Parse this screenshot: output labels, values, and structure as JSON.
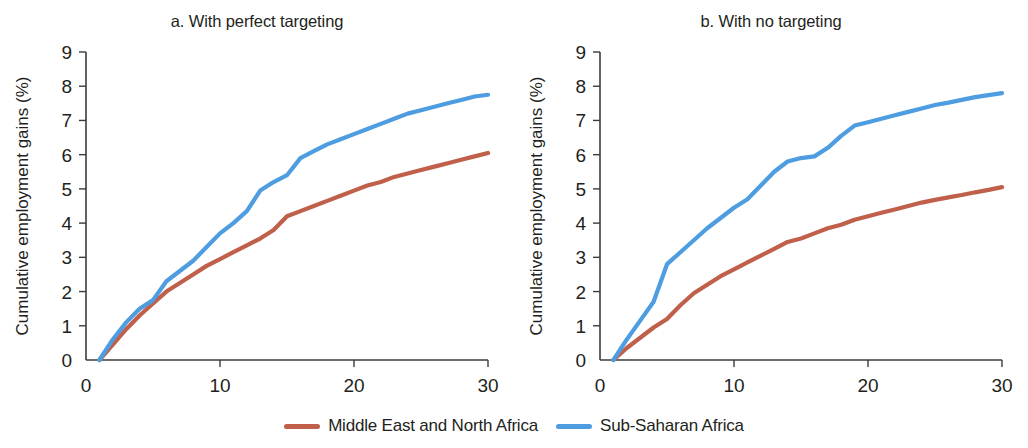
{
  "figure": {
    "background": "#ffffff",
    "legend": {
      "position": "bottom-center",
      "items": [
        {
          "label": "Middle East and North Africa",
          "color": "#c0604b",
          "swatch": "line-swatch"
        },
        {
          "label": "Sub-Saharan Africa",
          "color": "#4d9de0",
          "swatch": "line-swatch"
        }
      ]
    }
  },
  "chart_data": [
    {
      "type": "line",
      "panel": "a",
      "title": "a. With perfect targeting",
      "xlabel": "Year",
      "ylabel": "Cumulative employment gains (%)",
      "xlim": [
        0,
        30
      ],
      "ylim": [
        0,
        9
      ],
      "xticks": [
        0,
        10,
        20,
        30
      ],
      "xtick_labels": [
        "0",
        "10",
        "20",
        "30"
      ],
      "yticks": [
        0,
        1,
        2,
        3,
        4,
        5,
        6,
        7,
        8,
        9
      ],
      "ytick_labels": [
        "0",
        "1",
        "2",
        "3",
        "4",
        "5",
        "6",
        "7",
        "8",
        "9"
      ],
      "grid": false,
      "x": [
        1,
        2,
        3,
        4,
        5,
        6,
        7,
        8,
        9,
        10,
        11,
        12,
        13,
        14,
        15,
        16,
        17,
        18,
        19,
        20,
        21,
        22,
        23,
        24,
        25,
        26,
        27,
        28,
        29,
        30
      ],
      "series": [
        {
          "name": "Middle East and North Africa",
          "color": "#c0604b",
          "values": [
            0.0,
            0.45,
            0.9,
            1.3,
            1.65,
            2.0,
            2.25,
            2.5,
            2.75,
            2.95,
            3.15,
            3.35,
            3.55,
            3.8,
            4.2,
            4.35,
            4.5,
            4.65,
            4.8,
            4.95,
            5.1,
            5.2,
            5.35,
            5.45,
            5.55,
            5.65,
            5.75,
            5.85,
            5.95,
            6.05
          ]
        },
        {
          "name": "Sub-Saharan Africa",
          "color": "#4d9de0",
          "values": [
            0.0,
            0.6,
            1.1,
            1.5,
            1.75,
            2.3,
            2.6,
            2.9,
            3.3,
            3.7,
            4.0,
            4.35,
            4.95,
            5.2,
            5.4,
            5.9,
            6.1,
            6.3,
            6.45,
            6.6,
            6.75,
            6.9,
            7.05,
            7.2,
            7.3,
            7.4,
            7.5,
            7.6,
            7.7,
            7.75
          ]
        }
      ]
    },
    {
      "type": "line",
      "panel": "b",
      "title": "b. With no targeting",
      "xlabel": "Year",
      "ylabel": "Cumulative employment gains (%)",
      "xlim": [
        0,
        30
      ],
      "ylim": [
        0,
        9
      ],
      "xticks": [
        0,
        10,
        20,
        30
      ],
      "xtick_labels": [
        "0",
        "10",
        "20",
        "30"
      ],
      "yticks": [
        0,
        1,
        2,
        3,
        4,
        5,
        6,
        7,
        8,
        9
      ],
      "ytick_labels": [
        "0",
        "1",
        "2",
        "3",
        "4",
        "5",
        "6",
        "7",
        "8",
        "9"
      ],
      "grid": false,
      "x": [
        1,
        2,
        3,
        4,
        5,
        6,
        7,
        8,
        9,
        10,
        11,
        12,
        13,
        14,
        15,
        16,
        17,
        18,
        19,
        20,
        21,
        22,
        23,
        24,
        25,
        26,
        27,
        28,
        29,
        30
      ],
      "series": [
        {
          "name": "Middle East and North Africa",
          "color": "#c0604b",
          "values": [
            0.0,
            0.35,
            0.65,
            0.95,
            1.2,
            1.6,
            1.95,
            2.2,
            2.45,
            2.65,
            2.85,
            3.05,
            3.25,
            3.45,
            3.55,
            3.7,
            3.85,
            3.95,
            4.1,
            4.2,
            4.3,
            4.4,
            4.5,
            4.6,
            4.68,
            4.75,
            4.82,
            4.9,
            4.97,
            5.05
          ]
        },
        {
          "name": "Sub-Saharan Africa",
          "color": "#4d9de0",
          "values": [
            0.0,
            0.6,
            1.15,
            1.7,
            2.8,
            3.15,
            3.5,
            3.85,
            4.15,
            4.45,
            4.7,
            5.1,
            5.5,
            5.8,
            5.9,
            5.95,
            6.2,
            6.55,
            6.85,
            6.95,
            7.05,
            7.15,
            7.25,
            7.35,
            7.45,
            7.52,
            7.6,
            7.68,
            7.74,
            7.8
          ]
        }
      ]
    }
  ]
}
